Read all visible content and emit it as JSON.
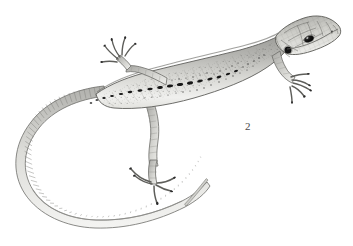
{
  "figure": {
    "kind": "scientific-illustration",
    "label": "2",
    "label_position": {
      "x": 245,
      "y": 121
    },
    "background_color": "#ffffff",
    "ink_color": "#5d5d5d",
    "dark_marking_color": "#1c1c1c",
    "body_light_color": "#f2f2f0",
    "body_mid_color": "#b8b8b4",
    "body_dark_color": "#8a8a86",
    "canvas": {
      "width": 353,
      "height": 246
    }
  },
  "anatomy": {
    "head": {
      "name": "head",
      "tip_x": 339,
      "tip_y": 33,
      "description": "tapered snout pointing upper-right with plate-like scales"
    },
    "eye": {
      "name": "eye",
      "cx": 309,
      "cy": 39,
      "rx": 5.0,
      "ry": 3.0,
      "rotation": -22,
      "color": "#121212",
      "highlight_color": "#f6f6f6"
    },
    "tympanum": {
      "name": "ear-opening",
      "cx": 288,
      "cy": 50,
      "r": 3.6,
      "color": "#131313"
    },
    "nostril": {
      "name": "nostril",
      "cx": 332,
      "cy": 32,
      "r": 0.9
    },
    "dorsal_spots": {
      "name": "dorsal-spot-row",
      "color": "#171717",
      "count": 17,
      "points": [
        {
          "x": 236,
          "y": 71,
          "w": 4.2,
          "h": 2.0,
          "rot": -22
        },
        {
          "x": 228,
          "y": 74,
          "w": 4.6,
          "h": 2.2,
          "rot": -20
        },
        {
          "x": 219,
          "y": 77,
          "w": 5.0,
          "h": 2.4,
          "rot": -18
        },
        {
          "x": 210,
          "y": 79,
          "w": 5.4,
          "h": 2.6,
          "rot": -15
        },
        {
          "x": 200,
          "y": 81,
          "w": 5.8,
          "h": 2.8,
          "rot": -13
        },
        {
          "x": 190,
          "y": 83,
          "w": 6.2,
          "h": 3.0,
          "rot": -11
        },
        {
          "x": 180,
          "y": 84,
          "w": 6.4,
          "h": 3.0,
          "rot": -9
        },
        {
          "x": 170,
          "y": 86,
          "w": 6.2,
          "h": 2.9,
          "rot": -8
        },
        {
          "x": 160,
          "y": 87,
          "w": 5.8,
          "h": 2.8,
          "rot": -7
        },
        {
          "x": 150,
          "y": 89,
          "w": 5.4,
          "h": 2.6,
          "rot": -6
        },
        {
          "x": 140,
          "y": 90,
          "w": 5.0,
          "h": 2.5,
          "rot": -5
        },
        {
          "x": 130,
          "y": 92,
          "w": 4.6,
          "h": 2.3,
          "rot": -4
        },
        {
          "x": 121,
          "y": 94,
          "w": 4.2,
          "h": 2.2,
          "rot": -3
        },
        {
          "x": 112,
          "y": 96,
          "w": 3.8,
          "h": 2.0,
          "rot": -2
        },
        {
          "x": 104,
          "y": 98,
          "w": 3.4,
          "h": 1.9,
          "rot": 0
        },
        {
          "x": 97,
          "y": 100,
          "w": 3.0,
          "h": 1.7,
          "rot": 2
        },
        {
          "x": 91,
          "y": 103,
          "w": 2.6,
          "h": 1.6,
          "rot": 4
        }
      ]
    },
    "limbs": [
      {
        "name": "left-foreleg",
        "position": "raised-upper-left",
        "toes": 5
      },
      {
        "name": "right-foreleg",
        "position": "extended-lower-right",
        "toes": 5
      },
      {
        "name": "left-hindleg",
        "position": "extended-down",
        "toes": 5
      }
    ],
    "tail": {
      "name": "tail",
      "description": "long looping tail curving down-left then sweeping back to the right",
      "tip_x": 208,
      "tip_y": 154,
      "scale_rings": 74
    }
  }
}
